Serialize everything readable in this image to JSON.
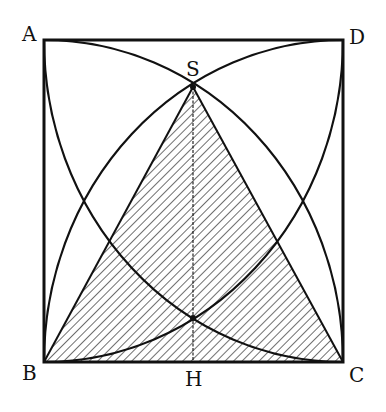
{
  "figure": {
    "type": "geometric-construction",
    "points": {
      "A": {
        "label": "A",
        "x": 44,
        "y": 40
      },
      "D": {
        "label": "D",
        "x": 343,
        "y": 40
      },
      "B": {
        "label": "B",
        "x": 44,
        "y": 362
      },
      "C": {
        "label": "C",
        "x": 343,
        "y": 362
      },
      "S": {
        "label": "S",
        "x": 193,
        "y": 87
      },
      "H": {
        "label": "H",
        "x": 193,
        "y": 362
      },
      "X": {
        "x": 193,
        "y": 318
      }
    },
    "labels": {
      "A": "A",
      "D": "D",
      "B": "B",
      "C": "C",
      "S": "S",
      "H": "H"
    },
    "shading": "diagonal hatching",
    "colors": {
      "stroke": "#111111",
      "background": "#ffffff"
    }
  }
}
